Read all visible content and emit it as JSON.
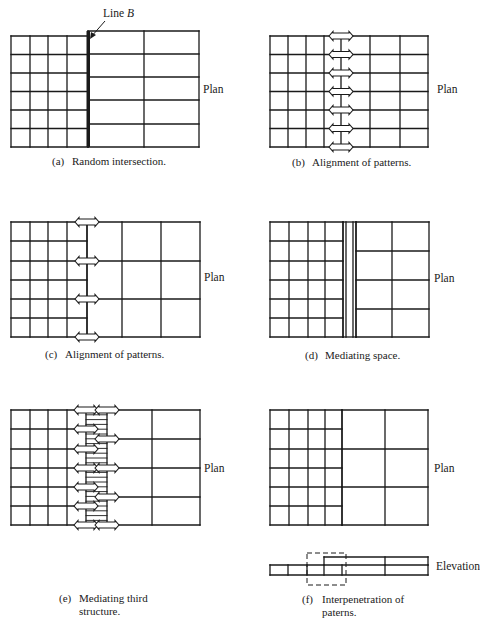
{
  "figure": {
    "annotation_line_b": {
      "text": "Line",
      "var": "B"
    },
    "plan_label": "Plan",
    "elevation_label": "Elevation",
    "panels": [
      {
        "id": "a",
        "tag": "(a)",
        "caption": "Random intersection."
      },
      {
        "id": "b",
        "tag": "(b)",
        "caption": "Alignment of patterns."
      },
      {
        "id": "c",
        "tag": "(c)",
        "caption": "Alignment of patterns."
      },
      {
        "id": "d",
        "tag": "(d)",
        "caption": "Mediating space."
      },
      {
        "id": "e",
        "tag": "(e)",
        "caption_line1": "Mediating third",
        "caption_line2": "structure."
      },
      {
        "id": "f",
        "tag": "(f)",
        "caption_line1": "Interpenetration of",
        "caption_line2": "paterns."
      }
    ]
  },
  "colors": {
    "line": "#1a1a1a",
    "background": "#ffffff"
  },
  "geometry": {
    "a": {
      "small": {
        "x": [
          11,
          30,
          48,
          67,
          88
        ],
        "y": [
          36,
          54.5,
          73,
          91.5,
          110,
          128.5,
          147
        ]
      },
      "large": {
        "x": [
          88,
          144,
          199
        ],
        "y": [
          31,
          54,
          77,
          100,
          124,
          147
        ]
      },
      "line_b_x": 88
    },
    "b": {
      "grid": {
        "x": [
          270,
          288,
          306,
          324,
          341,
          370,
          400,
          428
        ],
        "y": [
          36,
          54.5,
          73,
          91.5,
          110,
          128.5,
          147
        ]
      },
      "arrow_x": [
        341
      ],
      "arrow_y": [
        36,
        54.5,
        73,
        91.5,
        110,
        128.5,
        147
      ]
    },
    "c": {
      "small": {
        "x": [
          11,
          30,
          48,
          67,
          87
        ],
        "y": [
          222,
          241,
          261,
          280,
          299,
          318,
          337
        ]
      },
      "large": {
        "x": [
          87,
          122,
          161,
          200
        ],
        "y": [
          222,
          261,
          299,
          337
        ]
      },
      "arrows": [
        [
          87,
          222
        ],
        [
          87,
          261
        ],
        [
          87,
          299
        ],
        [
          87,
          337
        ]
      ]
    },
    "d": {
      "small": {
        "x": [
          270,
          289,
          308,
          325,
          343
        ],
        "y": [
          222,
          241,
          261,
          280,
          299,
          318,
          337
        ]
      },
      "gap": [
        343,
        346,
        353,
        356
      ],
      "large": {
        "x": [
          356,
          392,
          429
        ],
        "y": [
          222,
          251,
          280,
          309,
          337
        ]
      }
    },
    "e": {
      "small": {
        "x": [
          11,
          30,
          48,
          67,
          86
        ],
        "y": [
          410,
          429,
          449,
          468,
          487,
          506,
          525
        ]
      },
      "strip": {
        "x0": 86,
        "x1": 107,
        "hatch_step": 4.8
      },
      "large": {
        "x": [
          107,
          152,
          200
        ],
        "y": [
          410,
          439,
          468,
          497,
          525
        ]
      },
      "arrows_left": [
        [
          86,
          410
        ],
        [
          86,
          429
        ],
        [
          86,
          449
        ],
        [
          86,
          468
        ],
        [
          86,
          487
        ],
        [
          86,
          506
        ],
        [
          86,
          525
        ]
      ],
      "arrows_right": [
        [
          107,
          410
        ],
        [
          107,
          439
        ],
        [
          107,
          468
        ],
        [
          107,
          497
        ],
        [
          107,
          525
        ]
      ]
    },
    "f": {
      "small": {
        "x": [
          270,
          289,
          308,
          325,
          342
        ],
        "y": [
          410,
          429,
          449,
          468,
          487,
          506,
          525
        ]
      },
      "large": {
        "x": [
          342,
          385,
          428
        ],
        "y": [
          410,
          449,
          487,
          525
        ]
      },
      "elev_low": {
        "x": [
          270,
          288,
          307,
          324,
          342,
          385,
          428
        ],
        "y0": 565,
        "y1": 575
      },
      "elev_high": {
        "x": [
          324,
          385,
          428
        ],
        "y0": 557,
        "y1": 565
      },
      "dashed": {
        "x0": 307,
        "y0": 553,
        "x1": 346,
        "y1": 585
      }
    }
  }
}
